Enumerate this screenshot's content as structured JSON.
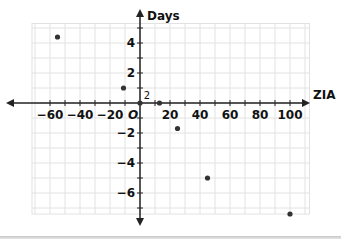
{
  "chart_data": {
    "type": "scatter",
    "title": "",
    "xlabel": "ZIA",
    "ylabel": "Days",
    "origin_label": "O",
    "xlim": [
      -70,
      110
    ],
    "ylim": [
      -7,
      5
    ],
    "grid": true,
    "x_ticks": [
      -60,
      -40,
      -20,
      2,
      20,
      40,
      60,
      80,
      100
    ],
    "x_tick_labels": [
      "−60",
      "−40",
      "−20",
      "2",
      "20",
      "40",
      "60",
      "80",
      "100"
    ],
    "y_ticks": [
      4,
      2,
      -2,
      -4,
      -6
    ],
    "y_tick_labels": [
      "4",
      "2",
      "−2",
      "−4",
      "−6"
    ],
    "points": [
      {
        "x": -55,
        "y": 4.4
      },
      {
        "x": -11,
        "y": 1
      },
      {
        "x": 0,
        "y": 0
      },
      {
        "x": 13,
        "y": 0
      },
      {
        "x": 25,
        "y": -1.7
      },
      {
        "x": 45,
        "y": -5
      },
      {
        "x": 100,
        "y": -7.4
      }
    ],
    "colors": {
      "point": "#333333",
      "axis": "#222222",
      "grid": "#e2e2e2"
    }
  }
}
